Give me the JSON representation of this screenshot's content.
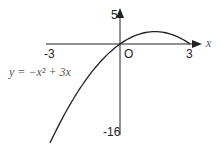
{
  "chart_data": {
    "type": "line",
    "title": "",
    "equation": "y = −x² + 3x",
    "xlabel": "x",
    "ylabel": "",
    "origin_label": "O",
    "x_ticks": [
      "-3",
      "3"
    ],
    "y_ticks": [
      "5",
      "-16"
    ],
    "xlim": [
      -3,
      3
    ],
    "ylim": [
      -18,
      5
    ],
    "grid": false,
    "series": [
      {
        "name": "y = -x^2 + 3x",
        "x": [
          -3,
          -2.5,
          -2,
          -1.5,
          -1,
          -0.5,
          0,
          0.5,
          1,
          1.5,
          2,
          2.5,
          3
        ],
        "y": [
          -18,
          -13.75,
          -10,
          -6.75,
          -4,
          -1.75,
          0,
          1.25,
          2,
          2.25,
          2,
          1.25,
          0
        ]
      }
    ]
  },
  "labels": {
    "y_top": "5",
    "y_bottom": "-16",
    "x_left": "-3",
    "x_right": "3",
    "origin": "O",
    "x_axis": "x",
    "equation": "y = −x² + 3x"
  }
}
